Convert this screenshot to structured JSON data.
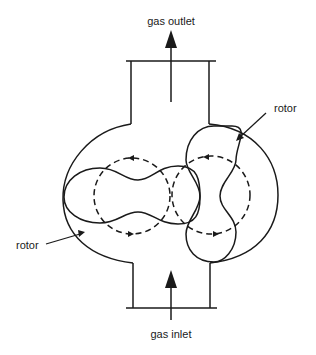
{
  "diagram": {
    "labels": {
      "outlet": "gas outlet",
      "inlet": "gas inlet",
      "rotor_right": "rotor",
      "rotor_left": "rotor"
    },
    "colors": {
      "stroke": "#1a1a1a",
      "background": "#ffffff"
    }
  }
}
